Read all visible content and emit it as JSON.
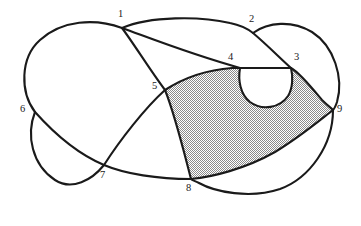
{
  "figure": {
    "canvas": {
      "width": 361,
      "height": 226
    },
    "colors": {
      "curve": "#1a1a1a",
      "background": "#ffffff",
      "shading_dark": "#808080",
      "shading_light": "#ffffff",
      "label": "#1a1a1a"
    },
    "curve_stroke_width": 2.1,
    "shaded_region": {
      "name": "shaded-region",
      "fill_pattern": "checkerboard-dither",
      "vertices": [
        "5",
        "4",
        "3",
        "9",
        "8"
      ]
    }
  },
  "crossings": [
    {
      "id": "1",
      "label": "1",
      "x": 122,
      "y": 28,
      "label_x": 118,
      "label_y": 9
    },
    {
      "id": "2",
      "label": "2",
      "x": 253,
      "y": 33,
      "label_x": 249,
      "label_y": 14
    },
    {
      "id": "3",
      "label": "3",
      "x": 291,
      "y": 68,
      "label_x": 294,
      "label_y": 52
    },
    {
      "id": "4",
      "label": "4",
      "x": 240,
      "y": 68,
      "label_x": 228,
      "label_y": 52
    },
    {
      "id": "5",
      "label": "5",
      "x": 165,
      "y": 90,
      "label_x": 152,
      "label_y": 81
    },
    {
      "id": "6",
      "label": "6",
      "x": 35,
      "y": 112,
      "label_x": 20,
      "label_y": 104
    },
    {
      "id": "7",
      "label": "7",
      "x": 104,
      "y": 165,
      "label_x": 100,
      "label_y": 170
    },
    {
      "id": "8",
      "label": "8",
      "x": 191,
      "y": 179,
      "label_x": 186,
      "label_y": 183
    },
    {
      "id": "9",
      "label": "9",
      "x": 333,
      "y": 110,
      "label_x": 337,
      "label_y": 104
    }
  ]
}
